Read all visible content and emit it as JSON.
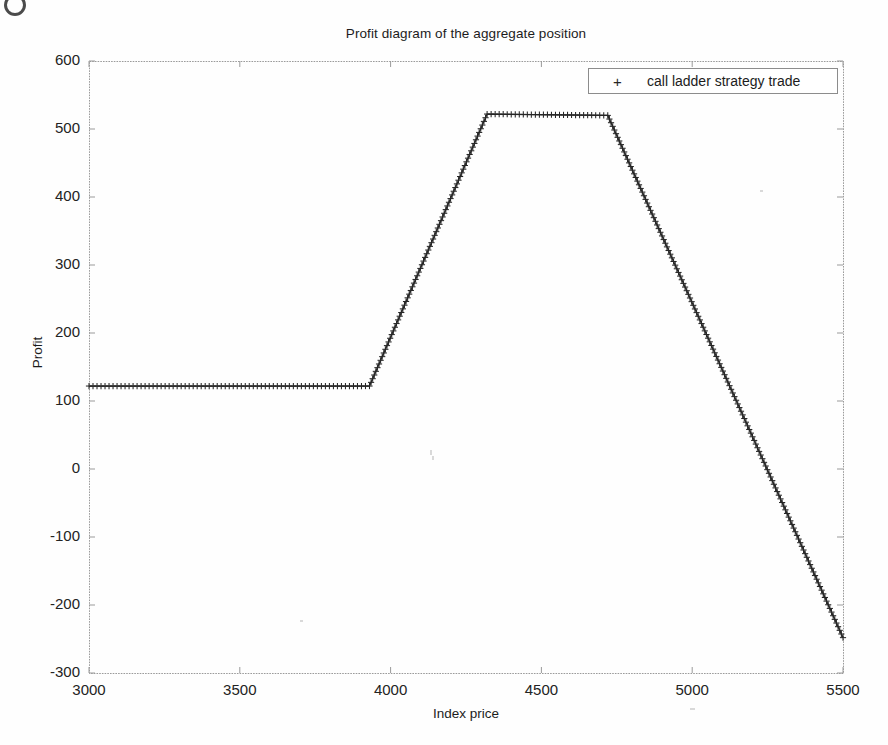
{
  "figure": {
    "width": 888,
    "height": 745,
    "background": "#fefefe",
    "axis_color": "#9a9a9a",
    "series_color": "#262626"
  },
  "chart_data": {
    "type": "line",
    "title": "Profit diagram of the aggregate position",
    "xlabel": "Index price",
    "ylabel": "Profit",
    "xlim": [
      3000,
      5500
    ],
    "ylim": [
      -300,
      600
    ],
    "xticks": [
      3000,
      3500,
      4000,
      4500,
      5000,
      5500
    ],
    "yticks": [
      -300,
      -200,
      -100,
      0,
      100,
      200,
      300,
      400,
      500,
      600
    ],
    "grid": false,
    "marker": "+",
    "legend_position": "upper right",
    "legend": [
      "call ladder strategy trade"
    ],
    "series": [
      {
        "name": "call ladder strategy trade",
        "breakpoints": [
          {
            "x": 3000,
            "y": 122
          },
          {
            "x": 3930,
            "y": 122
          },
          {
            "x": 4320,
            "y": 522
          },
          {
            "x": 4720,
            "y": 520
          },
          {
            "x": 5500,
            "y": -248
          }
        ],
        "x": [
          3000,
          3050,
          3100,
          3150,
          3200,
          3250,
          3300,
          3350,
          3400,
          3450,
          3500,
          3550,
          3600,
          3650,
          3700,
          3750,
          3800,
          3850,
          3900,
          3930,
          3980,
          4030,
          4080,
          4130,
          4180,
          4230,
          4280,
          4320,
          4370,
          4420,
          4470,
          4520,
          4570,
          4620,
          4670,
          4720,
          4770,
          4820,
          4870,
          4920,
          4970,
          5020,
          5070,
          5120,
          5170,
          5220,
          5270,
          5320,
          5370,
          5420,
          5470,
          5500
        ],
        "values": [
          122,
          122,
          122,
          122,
          122,
          122,
          122,
          122,
          122,
          122,
          122,
          122,
          122,
          122,
          122,
          122,
          122,
          122,
          122,
          122,
          173,
          224,
          276,
          327,
          378,
          429,
          481,
          522,
          522,
          521,
          521,
          521,
          520,
          520,
          520,
          520,
          471,
          422,
          372,
          323,
          274,
          224,
          175,
          126,
          76,
          27,
          -22,
          -71,
          -121,
          -170,
          -219,
          -248
        ]
      }
    ]
  },
  "plot_box": {
    "left": 89,
    "top": 61,
    "right": 843,
    "bottom": 673
  }
}
